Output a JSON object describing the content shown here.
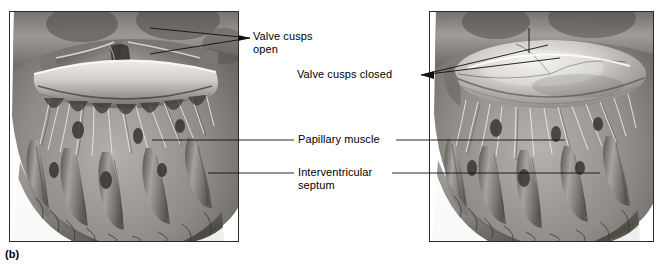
{
  "figure": {
    "caption": "(b)",
    "panels": [
      {
        "id": "left",
        "name": "atrioventricular-valve-open",
        "description": "Superior cutaway view of a heart ventricle showing the atrioventricular valve cusps in the open position, with chordae tendineae and papillary muscles below"
      },
      {
        "id": "right",
        "name": "atrioventricular-valve-closed",
        "description": "Superior cutaway view of a heart ventricle showing the atrioventricular valve cusps in the closed position, with chordae tendineae taut and papillary muscles contracted"
      }
    ],
    "labels": [
      {
        "id": "valve_cusps_open",
        "line1": "Valve cusps",
        "line2": "open",
        "target": "left-panel-valve"
      },
      {
        "id": "valve_cusps_closed",
        "line1": "Valve cusps closed",
        "line2": "",
        "target": "right-panel-valve"
      },
      {
        "id": "papillary_muscle",
        "line1": "Papillary muscle",
        "line2": "",
        "target": "both-panels"
      },
      {
        "id": "interventricular_septum",
        "line1": "Interventricular",
        "line2": "septum",
        "target": "both-panels"
      }
    ],
    "colors": {
      "line": "#1a1a1a",
      "panel_border": "#2b2b2b",
      "text": "#000000",
      "background": "#ffffff",
      "tissue_light": "#d8d6d2",
      "tissue_mid": "#a09d99",
      "tissue_dark": "#5f5c58"
    }
  }
}
